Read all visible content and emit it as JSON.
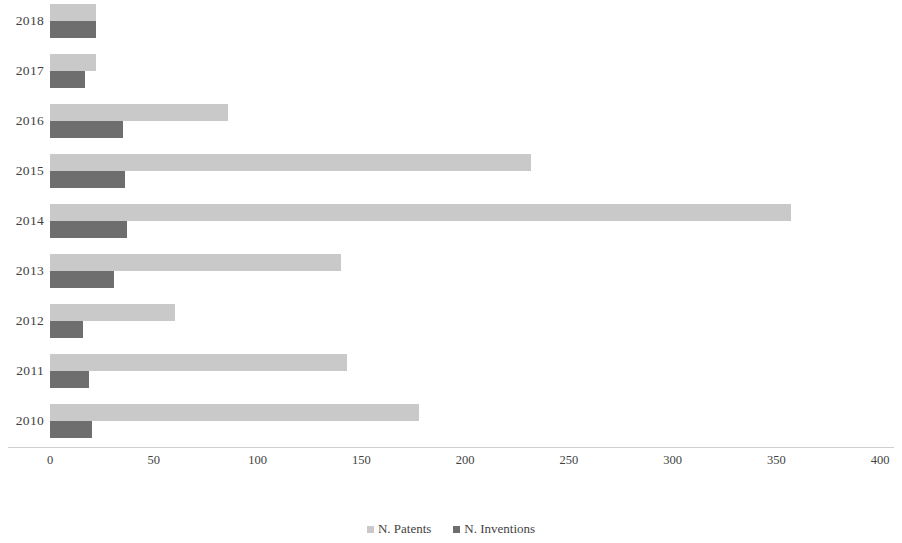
{
  "chart_data": {
    "type": "bar",
    "orientation": "horizontal",
    "title": "",
    "subtitle": "",
    "xlabel": "",
    "ylabel": "",
    "xlim": [
      0,
      400
    ],
    "xticks": [
      0,
      50,
      100,
      150,
      200,
      250,
      300,
      350,
      400
    ],
    "xtick_labels": [
      "0",
      "50",
      "100",
      "150",
      "200",
      "250",
      "300",
      "350",
      "400"
    ],
    "grid": false,
    "legend_position": "bottom",
    "categories": [
      "2018",
      "2017",
      "2016",
      "2015",
      "2014",
      "2013",
      "2012",
      "2011",
      "2010"
    ],
    "series": [
      {
        "name": "N. Patents",
        "color": "#c9c9c9",
        "values": [
          22,
          22,
          86,
          232,
          357,
          140,
          60,
          143,
          178
        ]
      },
      {
        "name": "N. Inventions",
        "color": "#6e6e6e",
        "values": [
          22,
          17,
          35,
          36,
          37,
          31,
          16,
          19,
          20
        ]
      }
    ]
  },
  "legend": {
    "items": [
      {
        "label": "N. Patents",
        "color": "#c9c9c9",
        "swatch_name": "legend-swatch-patents"
      },
      {
        "label": "N. Inventions",
        "color": "#6e6e6e",
        "swatch_name": "legend-swatch-inventions"
      }
    ]
  }
}
